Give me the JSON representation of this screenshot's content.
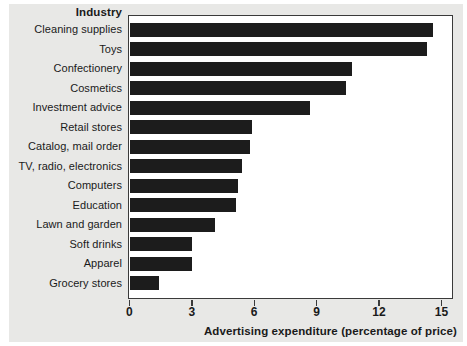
{
  "chart_data": {
    "type": "bar",
    "orientation": "horizontal",
    "title": "",
    "category_axis_title": "Industry",
    "xlabel": "Advertising expenditure (percentage of price)",
    "ylabel": "Industry",
    "xlim": [
      0,
      15.6
    ],
    "xticks": [
      0,
      3,
      6,
      9,
      12,
      15
    ],
    "xtick_labels": [
      "0",
      "3",
      "6",
      "9",
      "12",
      "15"
    ],
    "grid": false,
    "legend": false,
    "bar_color": "#1c1c1c",
    "plot_background": "#ffffff",
    "figure_background": "#e8e8e6",
    "categories": [
      "Cleaning supplies",
      "Toys",
      "Confectionery",
      "Cosmetics",
      "Investment advice",
      "Retail stores",
      "Catalog, mail order",
      "TV, radio, electronics",
      "Computers",
      "Education",
      "Lawn and garden",
      "Soft drinks",
      "Apparel",
      "Grocery stores"
    ],
    "values": [
      14.6,
      14.3,
      10.7,
      10.4,
      8.7,
      5.9,
      5.8,
      5.4,
      5.2,
      5.1,
      4.1,
      3.0,
      3.0,
      1.4
    ]
  }
}
